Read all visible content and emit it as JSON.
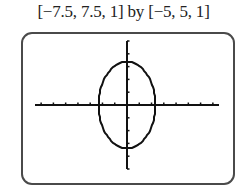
{
  "caption": "[−7.5, 7.5, 1] by [−5, 5, 1]",
  "chart_data": {
    "type": "line",
    "title": "[−7.5, 7.5, 1] by [−5, 5, 1]",
    "xlabel": "",
    "ylabel": "",
    "xlim": [
      -7.5,
      7.5
    ],
    "ylim": [
      -5,
      5
    ],
    "xscale": 1,
    "yscale": 1,
    "grid": false,
    "legend": null,
    "series": [
      {
        "name": "ellipse",
        "shape": "ellipse",
        "center": [
          0,
          0
        ],
        "semi_axis_x": 2.3,
        "semi_axis_y": 3.4,
        "x_intercepts": [
          -2.3,
          2.3
        ],
        "y_intercepts": [
          -3.4,
          3.4
        ]
      }
    ],
    "x_ticks": [
      -7,
      -6,
      -5,
      -4,
      -3,
      -2,
      -1,
      1,
      2,
      3,
      4,
      5,
      6,
      7
    ],
    "y_ticks": [
      -5,
      -4,
      -3,
      -2,
      -1,
      1,
      2,
      3,
      4,
      5
    ]
  }
}
